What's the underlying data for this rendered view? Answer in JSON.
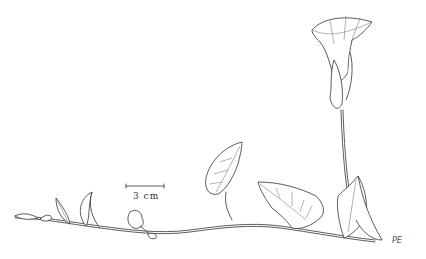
{
  "illustration": {
    "subject": "climbing vine with trumpet-shaped flower, line drawing",
    "scale_bar": {
      "label": "3 cm"
    },
    "signature": "PE",
    "colors": {
      "ink": "#333333",
      "background": "#ffffff"
    }
  }
}
